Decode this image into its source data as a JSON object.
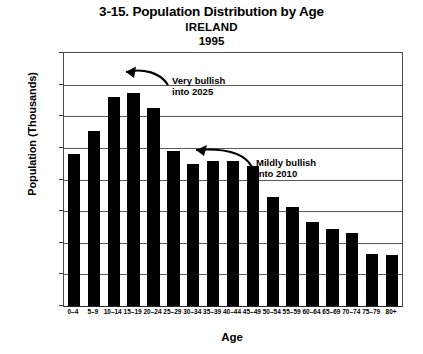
{
  "chart_data": {
    "type": "bar",
    "title": "3-15. Population Distribution by Age",
    "subtitle_country": "IRELAND",
    "subtitle_year": "1995",
    "xlabel": "Age",
    "ylabel": "Population (Thousands)",
    "categories": [
      "0–4",
      "5–9",
      "10–14",
      "15–19",
      "20–24",
      "25–29",
      "30–34",
      "35–39",
      "40–44",
      "45–49",
      "50–54",
      "55–59",
      "60–64",
      "65–69",
      "70–74",
      "75–79",
      "80+"
    ],
    "values": [
      241,
      276,
      330,
      337,
      313,
      245,
      225,
      230,
      230,
      222,
      173,
      156,
      133,
      122,
      115,
      82,
      81
    ],
    "ylim": [
      0,
      400
    ],
    "yticks": [
      0,
      50,
      100,
      150,
      200,
      250,
      300,
      350,
      400
    ],
    "ytick_labels": [
      "0",
      "50",
      "100",
      "150",
      "200",
      "250",
      "300",
      "350",
      "400"
    ],
    "grid": true,
    "grid_axis": "y",
    "legend": null,
    "bar_color": "#000000",
    "annotations": [
      {
        "text": "Very bullish\ninto 2025",
        "arrow_from_category": "10–14",
        "arrow_to_category": "10–14",
        "arrow_direction": "left"
      },
      {
        "text": "Mildly bullish\ninto 2010",
        "arrow_from_category": "30–34",
        "arrow_to_category": "30–34",
        "arrow_direction": "left"
      }
    ]
  }
}
